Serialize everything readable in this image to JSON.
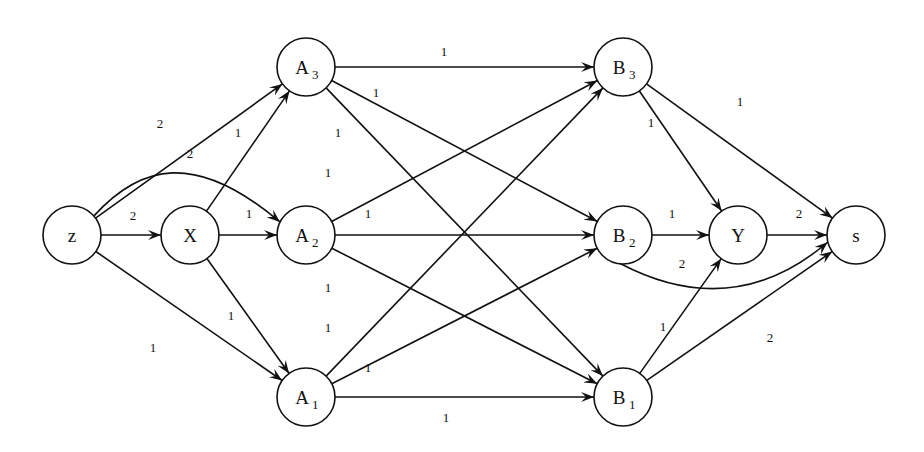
{
  "diagram": {
    "title": "",
    "nodes": [
      {
        "id": "z",
        "label": "z",
        "sub": "",
        "x": 72,
        "y": 235
      },
      {
        "id": "X",
        "label": "X",
        "sub": "",
        "x": 190,
        "y": 235
      },
      {
        "id": "A3",
        "label": "A",
        "sub": "3",
        "x": 306,
        "y": 67
      },
      {
        "id": "A2",
        "label": "A",
        "sub": "2",
        "x": 306,
        "y": 235
      },
      {
        "id": "A1",
        "label": "A",
        "sub": "1",
        "x": 306,
        "y": 397
      },
      {
        "id": "B3",
        "label": "B",
        "sub": "3",
        "x": 623,
        "y": 67
      },
      {
        "id": "B2",
        "label": "B",
        "sub": "2",
        "x": 623,
        "y": 235
      },
      {
        "id": "B1",
        "label": "B",
        "sub": "1",
        "x": 623,
        "y": 397
      },
      {
        "id": "Y",
        "label": "Y",
        "sub": "",
        "x": 738,
        "y": 235
      },
      {
        "id": "s",
        "label": "s",
        "sub": "",
        "x": 856,
        "y": 235
      }
    ],
    "edges": [
      {
        "from": "z",
        "to": "A3",
        "weight": "2",
        "lx": 160,
        "ly": 128
      },
      {
        "from": "z",
        "to": "A2",
        "weight": "2",
        "lx": 190,
        "ly": 158,
        "curved": true
      },
      {
        "from": "z",
        "to": "X",
        "weight": "2",
        "lx": 133,
        "ly": 220
      },
      {
        "from": "z",
        "to": "A1",
        "weight": "1",
        "lx": 153,
        "ly": 352
      },
      {
        "from": "X",
        "to": "A3",
        "weight": "1",
        "lx": 238,
        "ly": 137
      },
      {
        "from": "X",
        "to": "A2",
        "weight": "1",
        "lx": 249,
        "ly": 218
      },
      {
        "from": "X",
        "to": "A1",
        "weight": "1",
        "lx": 231,
        "ly": 320
      },
      {
        "from": "A3",
        "to": "B3",
        "weight": "1",
        "lx": 444,
        "ly": 56
      },
      {
        "from": "A3",
        "to": "B2",
        "weight": "1",
        "lx": 376,
        "ly": 97
      },
      {
        "from": "A3",
        "to": "B1",
        "weight": "1",
        "lx": 338,
        "ly": 137
      },
      {
        "from": "A2",
        "to": "B3",
        "weight": "1",
        "lx": 328,
        "ly": 177
      },
      {
        "from": "A2",
        "to": "B2",
        "weight": "1",
        "lx": 368,
        "ly": 218
      },
      {
        "from": "A2",
        "to": "B1",
        "weight": "1",
        "lx": 328,
        "ly": 292
      },
      {
        "from": "A1",
        "to": "B3",
        "weight": "1",
        "lx": 328,
        "ly": 332
      },
      {
        "from": "A1",
        "to": "B2",
        "weight": "1",
        "lx": 368,
        "ly": 372
      },
      {
        "from": "A1",
        "to": "B1",
        "weight": "1",
        "lx": 446,
        "ly": 422
      },
      {
        "from": "B3",
        "to": "Y",
        "weight": "1",
        "lx": 651,
        "ly": 127
      },
      {
        "from": "B3",
        "to": "s",
        "weight": "1",
        "lx": 740,
        "ly": 106
      },
      {
        "from": "B2",
        "to": "Y",
        "weight": "1",
        "lx": 672,
        "ly": 218
      },
      {
        "from": "B2",
        "to": "s",
        "weight": "2",
        "lx": 682,
        "ly": 268,
        "curved": true
      },
      {
        "from": "Y",
        "to": "s",
        "weight": "2",
        "lx": 799,
        "ly": 218
      },
      {
        "from": "B1",
        "to": "Y",
        "weight": "1",
        "lx": 663,
        "ly": 331
      },
      {
        "from": "B1",
        "to": "s",
        "weight": "2",
        "lx": 770,
        "ly": 342
      }
    ]
  }
}
